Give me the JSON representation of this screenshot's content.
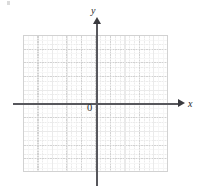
{
  "figure": {
    "kind": "cartesian-coordinate-grid",
    "background_color": "#ffffff",
    "width": 199,
    "height": 192
  },
  "axes": {
    "x_label": "x",
    "y_label": "y",
    "origin_label": "0",
    "axis_color": "#57575c",
    "arrow_color": "#3a3a3f",
    "x_axis_has_arrow": true,
    "y_axis_has_arrow": true
  },
  "grid": {
    "major_color": "#d2d2d2",
    "minor_color": "#ebebeb",
    "major_columns": 10,
    "major_rows": 10,
    "minor_per_major": 3,
    "left": 23,
    "top": 35,
    "width": 145,
    "height": 137
  },
  "chart_data": {
    "type": "scatter",
    "title": "",
    "xlabel": "x",
    "ylabel": "y",
    "xlim": [
      -5,
      5
    ],
    "ylim": [
      -5,
      5
    ],
    "x": [],
    "y": [],
    "series": [],
    "grid": true,
    "legend": "none",
    "annotations": [
      "0"
    ],
    "xticklabels": [],
    "yticklabels": []
  }
}
